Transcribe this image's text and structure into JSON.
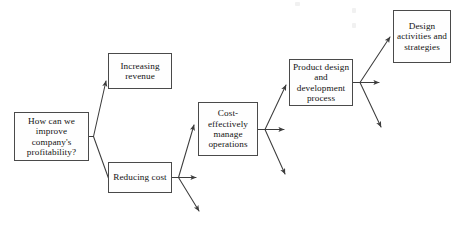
{
  "diagram": {
    "type": "tree-fan-diagram",
    "title": "",
    "background_color": "#ffffff",
    "line_color": "#3d3d3d",
    "box_border_color": "#4a4a4a",
    "box_fill_color": "#fefefe",
    "text_color": "#141414",
    "nodes": [
      {
        "id": "question",
        "label": "How can we improve company's profitability?",
        "level": 0
      },
      {
        "id": "increasing_revenue",
        "label": "Increasing revenue",
        "level": 1
      },
      {
        "id": "reducing_cost",
        "label": "Reducing cost",
        "level": 1
      },
      {
        "id": "cost_effective_ops",
        "label": "Cost-effectively manage operations",
        "level": 2
      },
      {
        "id": "product_design",
        "label": "Product design and development process",
        "level": 3
      },
      {
        "id": "design_activities",
        "label": "Design activities and strategies",
        "level": 4
      }
    ],
    "edges": [
      {
        "from": "question",
        "to": "increasing_revenue",
        "style": "branch-up"
      },
      {
        "from": "question",
        "to": "reducing_cost",
        "style": "branch-down"
      },
      {
        "from": "reducing_cost",
        "to": "cost_effective_ops",
        "style": "branch-up"
      },
      {
        "from": "reducing_cost",
        "to": "",
        "style": "branch-straight-open"
      },
      {
        "from": "reducing_cost",
        "to": "",
        "style": "branch-down-open"
      },
      {
        "from": "cost_effective_ops",
        "to": "product_design",
        "style": "branch-up"
      },
      {
        "from": "cost_effective_ops",
        "to": "",
        "style": "branch-straight-open"
      },
      {
        "from": "cost_effective_ops",
        "to": "",
        "style": "branch-down-open"
      },
      {
        "from": "product_design",
        "to": "design_activities",
        "style": "branch-up"
      },
      {
        "from": "product_design",
        "to": "",
        "style": "branch-straight-open"
      },
      {
        "from": "product_design",
        "to": "",
        "style": "branch-down-open"
      }
    ]
  }
}
